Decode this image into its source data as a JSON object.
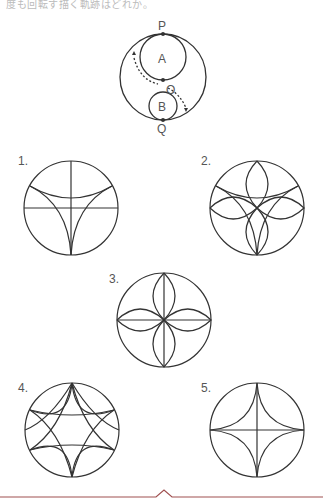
{
  "header": {
    "question_text_fragment": "度も回転す描く軌跡はどれか。"
  },
  "diagram": {
    "labels": {
      "top_point": "P",
      "bottom_point": "Q",
      "center": "O",
      "circle_a": "A",
      "circle_b": "B"
    }
  },
  "options": [
    {
      "number": "1.",
      "description": "three-cusp hypocycloid (deltoid) with horizontal and vertical diameters"
    },
    {
      "number": "2.",
      "description": "deltoid overlaid with four lens-shaped petals"
    },
    {
      "number": "3.",
      "description": "four lens petals with horizontal and vertical diameters"
    },
    {
      "number": "4.",
      "description": "two overlapping astroid-like star curves with six arcs"
    },
    {
      "number": "5.",
      "description": "four-cusp astroid with horizontal and vertical diameters"
    }
  ],
  "footer": {
    "accent_color": "#a05050"
  }
}
